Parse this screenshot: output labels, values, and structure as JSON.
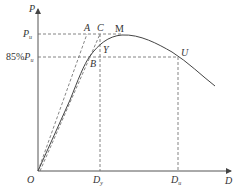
{
  "diagram": {
    "axes": {
      "y_label": "P",
      "x_label": "D",
      "origin_label": "O"
    },
    "y_levels": {
      "pu_label": "P",
      "pu_sub": "u",
      "p85_prefix": "85%",
      "p85_label": "P",
      "p85_sub": "u"
    },
    "x_levels": {
      "dy_label": "D",
      "dy_sub": "y",
      "du_label": "D",
      "du_sub": "u"
    },
    "points": {
      "A": "A",
      "B": "B",
      "C": "C",
      "M": "M",
      "Y": "Y",
      "U": "U"
    },
    "colors": {
      "curve": "#444444",
      "dashed": "#666666",
      "axis": "#555555"
    }
  }
}
